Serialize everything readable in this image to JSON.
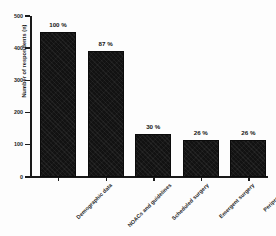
{
  "chart_data": {
    "type": "bar",
    "title": "",
    "xlabel": "",
    "ylabel": "Number of respondents (n)",
    "categories": [
      "Demographic data",
      "NOACs and guidelines",
      "Scheduled surgery",
      "Emergent surgery",
      "Periprocedure"
    ],
    "values": [
      450,
      390,
      133,
      115,
      115
    ],
    "data_labels": [
      "100 %",
      "87 %",
      "30 %",
      "26 %",
      "26 %"
    ],
    "percentages": [
      100,
      87,
      30,
      26,
      26
    ],
    "ylim": [
      0,
      500
    ],
    "yticks": [
      0,
      100,
      200,
      300,
      400,
      500
    ],
    "ytick_labels": [
      "0",
      "100",
      "200",
      "300",
      "400",
      "500"
    ],
    "grid": false,
    "legend": false,
    "bar_color": "#121212",
    "axis_color": "#1a1a1a",
    "background": "#ffffff"
  }
}
